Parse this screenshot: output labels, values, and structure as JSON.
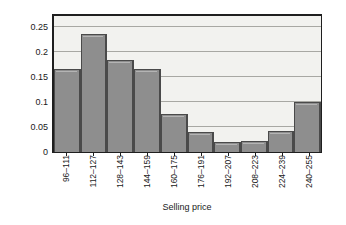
{
  "chart_data": {
    "type": "bar",
    "title": "",
    "xlabel": "Selling price",
    "ylabel": "Relative frequency",
    "categories": [
      "96–111",
      "112–127",
      "128–143",
      "144–159",
      "160–175",
      "176–191",
      "192–207",
      "208–223",
      "224–239",
      "240–255"
    ],
    "values": [
      0.167,
      0.236,
      0.184,
      0.167,
      0.076,
      0.04,
      0.021,
      0.022,
      0.042,
      0.101
    ],
    "ylim": [
      0,
      0.2785
    ],
    "yticks": [
      0,
      0.05,
      0.1,
      0.15,
      0.2,
      0.25
    ],
    "ytick_labels": [
      "0",
      "0.05",
      "0.1",
      "0.15",
      "0.2",
      "0.25"
    ],
    "grid": true,
    "grid_axis": "y",
    "legend": null,
    "bar_fill": "#8e8e8e",
    "bar_edge": "#4a4a4a",
    "plot_background": "#f2f2ef",
    "gridline_color": "#a8a8a3",
    "axis_color": "#1f1f1f"
  }
}
